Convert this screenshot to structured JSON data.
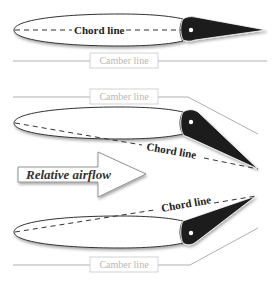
{
  "diagram": {
    "panels": [
      {
        "id": "neutral",
        "chord_label": "Chord line",
        "camber_label": "Camber line",
        "flap": "neutral"
      },
      {
        "id": "flap-down",
        "chord_label": "Chord line",
        "camber_label": "Camber line",
        "flap": "down"
      },
      {
        "id": "flap-up",
        "chord_label": "Chord line",
        "camber_label": "Camber line",
        "flap": "up"
      }
    ],
    "airflow_label": "Relative airflow",
    "colors": {
      "flap": "#1e1e1e",
      "outline": "#333333",
      "camber_line": "#b0b0b0",
      "camber_text": "#b8b8b8",
      "background": "#ffffff"
    }
  }
}
